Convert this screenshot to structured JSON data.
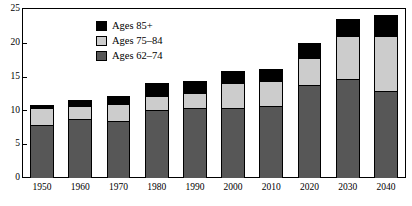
{
  "chart_data": {
    "type": "bar",
    "stacked": true,
    "title": "",
    "subtitle": "",
    "xlabel": "",
    "ylabel": "",
    "categories": [
      "1950",
      "1960",
      "1970",
      "1980",
      "1990",
      "2000",
      "2010",
      "2020",
      "2030",
      "2040"
    ],
    "series": [
      {
        "name": "Ages 62–74",
        "color": "#575757",
        "values": [
          7.9,
          8.7,
          8.5,
          10.0,
          10.4,
          10.3,
          10.7,
          13.7,
          14.7,
          12.9
        ]
      },
      {
        "name": "Ages 75–84",
        "color": "#cccccc",
        "values": [
          2.4,
          2.0,
          2.4,
          2.2,
          2.2,
          3.8,
          3.7,
          4.1,
          6.3,
          8.1
        ]
      },
      {
        "name": "Ages 85+",
        "color": "#000000",
        "values": [
          0.5,
          0.8,
          1.2,
          1.8,
          1.8,
          1.8,
          1.8,
          2.2,
          2.5,
          3.1
        ]
      }
    ],
    "totals": [
      10.8,
      11.5,
      12.1,
      14.0,
      14.4,
      15.9,
      16.2,
      20.0,
      23.5,
      24.1
    ],
    "ylim": [
      0,
      25
    ],
    "yticks": [
      0,
      5,
      10,
      15,
      20,
      25
    ],
    "ytick_labels": [
      "0",
      "5",
      "10",
      "15",
      "20",
      "25"
    ],
    "grid": false,
    "legend_position": "top-center",
    "legend_order": [
      "Ages 85+",
      "Ages 75–84",
      "Ages 62–74"
    ]
  },
  "legend": {
    "items": [
      {
        "label": "Ages 85+",
        "swatch": "legend-swatch-black"
      },
      {
        "label": "Ages 75–84",
        "swatch": "legend-swatch-lightgray"
      },
      {
        "label": "Ages 62–74",
        "swatch": "legend-swatch-darkgray"
      }
    ]
  },
  "colors": {
    "ages_85_plus": "#000000",
    "ages_75_84": "#cccccc",
    "ages_62_74": "#575757",
    "axis": "#000000",
    "background": "#ffffff"
  }
}
